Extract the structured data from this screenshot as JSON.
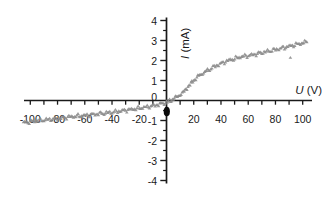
{
  "chart_data": {
    "type": "scatter",
    "title": "",
    "xlabel": "U (V)",
    "ylabel": "I (mA)",
    "xlabel_var": "U",
    "xlabel_unit": " (V)",
    "ylabel_var": "I",
    "ylabel_unit": " (mA)",
    "xlim": [
      -105,
      107
    ],
    "ylim": [
      -4,
      4
    ],
    "x_tick_step": 10,
    "y_major_tick_step": 1,
    "y_minor_tick_step": 0.5,
    "grid": false,
    "legend": false,
    "axis_color": "#1a1a1a",
    "x_tick_labels": [
      {
        "value": -100,
        "text": "-100"
      },
      {
        "value": -80,
        "text": "-80"
      },
      {
        "value": -60,
        "text": "-60"
      },
      {
        "value": -40,
        "text": "-40"
      },
      {
        "value": -20,
        "text": "-20"
      },
      {
        "value": 20,
        "text": "20"
      },
      {
        "value": 40,
        "text": "40"
      },
      {
        "value": 60,
        "text": "60"
      },
      {
        "value": 80,
        "text": "80"
      },
      {
        "value": 100,
        "text": "100"
      }
    ],
    "y_tick_labels": [
      {
        "value": 4,
        "text": "4"
      },
      {
        "value": 3,
        "text": "3"
      },
      {
        "value": 2,
        "text": "2"
      },
      {
        "value": 1,
        "text": "1"
      },
      {
        "value": 0,
        "text": "0"
      },
      {
        "value": -1,
        "text": "-1"
      },
      {
        "value": -2,
        "text": "-2"
      },
      {
        "value": -3,
        "text": "-3"
      },
      {
        "value": -4,
        "text": "-4"
      }
    ],
    "series": [
      {
        "name": "measured I-V points",
        "marker": "triangle",
        "color": "#8b8b8b",
        "points": [
          [
            -105,
            -1.1
          ],
          [
            -100,
            -1.05
          ],
          [
            -95,
            -1.0
          ],
          [
            -90,
            -0.97
          ],
          [
            -85,
            -0.93
          ],
          [
            -80,
            -0.9
          ],
          [
            -75,
            -0.85
          ],
          [
            -70,
            -0.8
          ],
          [
            -65,
            -0.77
          ],
          [
            -60,
            -0.74
          ],
          [
            -55,
            -0.7
          ],
          [
            -50,
            -0.66
          ],
          [
            -45,
            -0.62
          ],
          [
            -40,
            -0.58
          ],
          [
            -35,
            -0.53
          ],
          [
            -30,
            -0.48
          ],
          [
            -25,
            -0.43
          ],
          [
            -20,
            -0.38
          ],
          [
            -15,
            -0.32
          ],
          [
            -10,
            -0.26
          ],
          [
            -5,
            -0.18
          ],
          [
            0,
            -0.08
          ],
          [
            3,
            0.0
          ],
          [
            5,
            0.1
          ],
          [
            8,
            0.2
          ],
          [
            10,
            0.3
          ],
          [
            13,
            0.45
          ],
          [
            15,
            0.65
          ],
          [
            18,
            0.85
          ],
          [
            20,
            1.02
          ],
          [
            23,
            1.2
          ],
          [
            25,
            1.3
          ],
          [
            28,
            1.42
          ],
          [
            30,
            1.5
          ],
          [
            35,
            1.7
          ],
          [
            40,
            1.85
          ],
          [
            45,
            2.0
          ],
          [
            50,
            2.1
          ],
          [
            55,
            2.2
          ],
          [
            60,
            2.25
          ],
          [
            65,
            2.32
          ],
          [
            70,
            2.4
          ],
          [
            75,
            2.48
          ],
          [
            80,
            2.55
          ],
          [
            85,
            2.63
          ],
          [
            90,
            2.72
          ],
          [
            95,
            2.8
          ],
          [
            100,
            2.88
          ],
          [
            103,
            2.93
          ]
        ]
      }
    ],
    "outlier_points": [
      [
        91,
        2.15
      ]
    ],
    "origin_dot": {
      "u": 0,
      "i": -0.55,
      "color": "#0a0a0a"
    }
  }
}
